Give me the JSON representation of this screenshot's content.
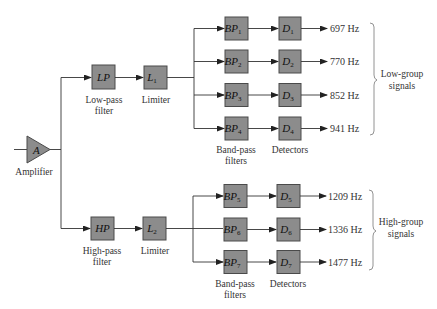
{
  "diagram": {
    "amplifier": {
      "symbol": "A",
      "label": "Amplifier"
    },
    "low_path": {
      "filter": {
        "symbol": "LP",
        "label_line1": "Low-pass",
        "label_line2": "filter"
      },
      "limiter": {
        "symbol": "L",
        "sub": "1",
        "label": "Limiter"
      },
      "bandpass_label_line1": "Band-pass",
      "bandpass_label_line2": "filters",
      "detectors_label": "Detectors",
      "channels": [
        {
          "bp": "BP",
          "bp_sub": "1",
          "d": "D",
          "d_sub": "1",
          "freq": "697 Hz"
        },
        {
          "bp": "BP",
          "bp_sub": "2",
          "d": "D",
          "d_sub": "2",
          "freq": "770 Hz"
        },
        {
          "bp": "BP",
          "bp_sub": "3",
          "d": "D",
          "d_sub": "3",
          "freq": "852 Hz"
        },
        {
          "bp": "BP",
          "bp_sub": "4",
          "d": "D",
          "d_sub": "4",
          "freq": "941 Hz"
        }
      ],
      "group_label_line1": "Low-group",
      "group_label_line2": "signals"
    },
    "high_path": {
      "filter": {
        "symbol": "HP",
        "label_line1": "High-pass",
        "label_line2": "filter"
      },
      "limiter": {
        "symbol": "L",
        "sub": "2",
        "label": "Limiter"
      },
      "bandpass_label_line1": "Band-pass",
      "bandpass_label_line2": "filters",
      "detectors_label": "Detectors",
      "channels": [
        {
          "bp": "BP",
          "bp_sub": "5",
          "d": "D",
          "d_sub": "5",
          "freq": "1209 Hz"
        },
        {
          "bp": "BP",
          "bp_sub": "6",
          "d": "D",
          "d_sub": "6",
          "freq": "1336 Hz"
        },
        {
          "bp": "BP",
          "bp_sub": "7",
          "d": "D",
          "d_sub": "7",
          "freq": "1477 Hz"
        }
      ],
      "group_label_line1": "High-group",
      "group_label_line2": "signals"
    },
    "colors": {
      "block_fill": "#8c8c8c",
      "block_stroke": "#4a4a4a",
      "wire": "#333333"
    }
  }
}
